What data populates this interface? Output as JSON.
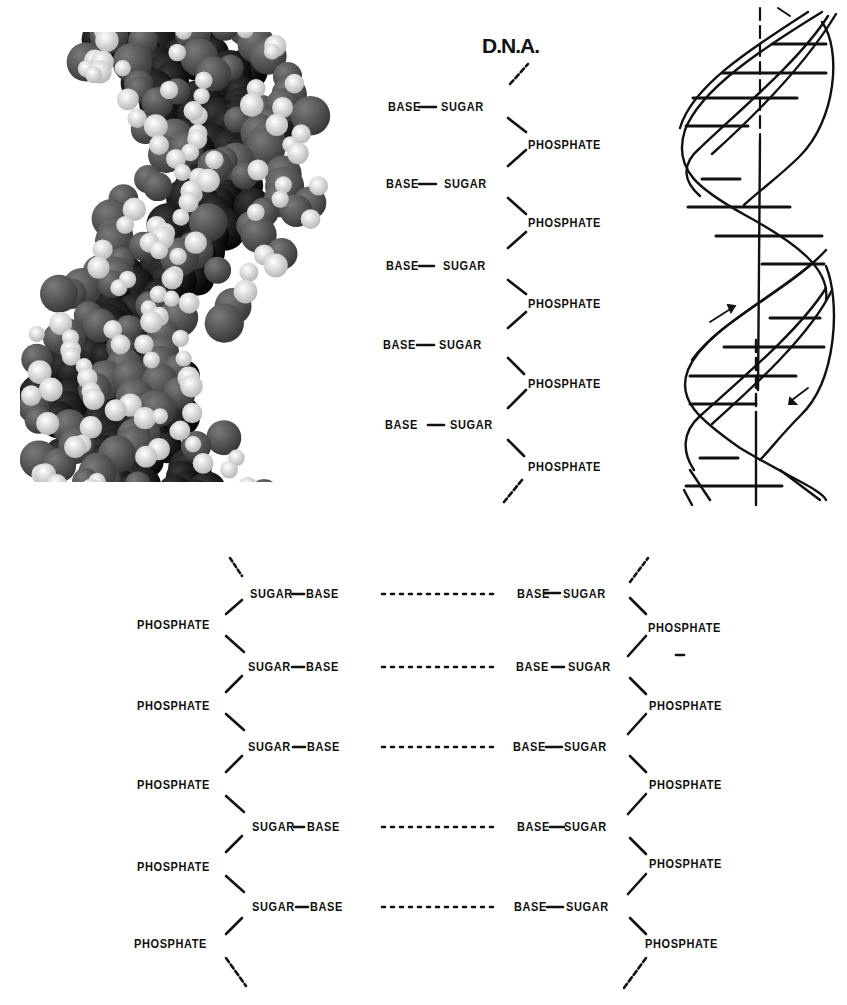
{
  "figure": {
    "panels": [
      {
        "id": "space-filling-model",
        "description": "Grayscale space-filling (CPK) molecular model of a DNA double helix"
      },
      {
        "id": "single-strand-schematic",
        "title": "D.N.A."
      },
      {
        "id": "double-helix-drawing",
        "description": "Line drawing of a double helix ribbon with horizontal base-pair rungs, vertical axis, and two arrows indicating strand direction"
      },
      {
        "id": "double-strand-schematic",
        "description": "Two antiparallel sugar-phosphate backbones joined by base pairs (dotted lines as hydrogen bonds)"
      }
    ]
  },
  "single_strand": {
    "title": "D.N.A.",
    "rows": [
      {
        "base": "BASE",
        "sugar": "SUGAR",
        "phosphate": "PHOSPHATE"
      },
      {
        "base": "BASE",
        "sugar": "SUGAR",
        "phosphate": "PHOSPHATE"
      },
      {
        "base": "BASE",
        "sugar": "SUGAR",
        "phosphate": "PHOSPHATE"
      },
      {
        "base": "BASE",
        "sugar": "SUGAR",
        "phosphate": "PHOSPHATE"
      },
      {
        "base": "BASE",
        "sugar": "SUGAR",
        "phosphate": "PHOSPHATE"
      }
    ]
  },
  "double_strand": {
    "rows": [
      {
        "left_sugar": "SUGAR",
        "left_base": "BASE",
        "bond": "............",
        "right_base": "BASE",
        "right_sugar": "SUGAR"
      },
      {
        "left_sugar": "SUGAR",
        "left_base": "BASE",
        "bond": "............",
        "right_base": "BASE",
        "right_sugar": "SUGAR"
      },
      {
        "left_sugar": "SUGAR",
        "left_base": "BASE",
        "bond": "............",
        "right_base": "BASE",
        "right_sugar": "SUGAR"
      },
      {
        "left_sugar": "SUGAR",
        "left_base": "BASE",
        "bond": "............",
        "right_base": "BASE",
        "right_sugar": "SUGAR"
      },
      {
        "left_sugar": "SUGAR",
        "left_base": "BASE",
        "bond": "............",
        "right_base": "BASE",
        "right_sugar": "SUGAR"
      }
    ],
    "left_phosphates": [
      "PHOSPHATE",
      "PHOSPHATE",
      "PHOSPHATE",
      "PHOSPHATE",
      "PHOSPHATE"
    ],
    "right_phosphates": [
      "PHOSPHATE",
      "PHOSPHATE",
      "PHOSPHATE",
      "PHOSPHATE",
      "PHOSPHATE"
    ]
  },
  "colors": {
    "ink": "#111111",
    "background": "#ffffff",
    "atom_dark": "#1a1a1a",
    "atom_mid": "#5a5a5a",
    "atom_light": "#e8e8e8"
  }
}
